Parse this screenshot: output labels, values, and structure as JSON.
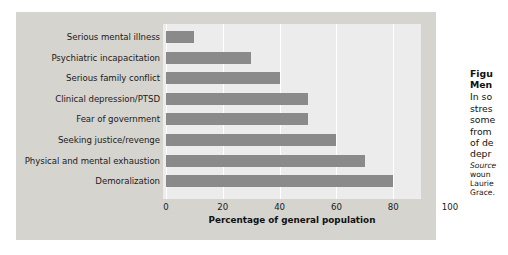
{
  "figure": {
    "background_color": "#d6d4cf",
    "plot_background_color": "#ececec",
    "bar_color": "#8a8a8a",
    "gridline_color": "#ffffff"
  },
  "chart_data": {
    "type": "bar",
    "orientation": "horizontal",
    "title": "",
    "xlabel": "Percentage of general population",
    "ylabel": "",
    "xlim": [
      0,
      100
    ],
    "xticks": [
      0,
      20,
      40,
      60,
      80,
      100
    ],
    "xtick_labels": [
      "0",
      "20",
      "40",
      "60",
      "80",
      "100"
    ],
    "grid": true,
    "grid_axis": "x",
    "legend": false,
    "categories": [
      "Serious mental illness",
      "Psychiatric incapacitation",
      "Serious family conflict",
      "Clinical depression/PTSD",
      "Fear of government",
      "Seeking justice/revenge",
      "Physical and mental exhaustion",
      "Demoralization"
    ],
    "values": [
      10,
      30,
      40,
      50,
      50,
      60,
      70,
      80
    ],
    "series": [
      {
        "name": "Percentage of general population",
        "values": [
          10,
          30,
          40,
          50,
          50,
          60,
          70,
          80
        ]
      }
    ]
  },
  "caption": {
    "title_line1": "Figu",
    "title_line2": "Men",
    "body_lines": [
      "In so",
      "stres",
      "some",
      "from",
      "of de",
      "depr"
    ],
    "source_label": "Source",
    "source_lines": [
      "woun",
      "Laurie",
      "Grace."
    ]
  }
}
